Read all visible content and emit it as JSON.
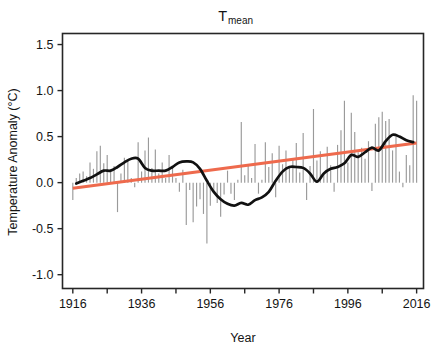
{
  "chart_data": {
    "type": "bar",
    "title_main": "T",
    "title_subscript": "mean",
    "xlabel": "Year",
    "ylabel": "Temperature Anomaly (°C)",
    "xlim": [
      1913,
      2018
    ],
    "ylim": [
      -1.15,
      1.62
    ],
    "xticks": [
      1916,
      1936,
      1956,
      1976,
      1996,
      2016
    ],
    "xtick_labels": [
      "1916",
      "1936",
      "1956",
      "1976",
      "1996",
      "2016"
    ],
    "yticks": [
      1.5,
      1.0,
      0.5,
      0.0,
      -0.5,
      -1.0
    ],
    "ytick_labels": [
      "1.5",
      "1.0",
      "0.5",
      "0.0",
      "-0.5",
      "-1.0"
    ],
    "grid": false,
    "legend": null,
    "colors": {
      "bars": "#9a9a9a",
      "smooth": "#111111",
      "trend": "#ee6a4d",
      "axis": "#262626",
      "background": "#ffffff"
    },
    "series": [
      {
        "name": "Annual temperature anomaly",
        "type": "bar",
        "x": [
          1916,
          1917,
          1918,
          1919,
          1920,
          1921,
          1922,
          1923,
          1924,
          1925,
          1926,
          1927,
          1928,
          1929,
          1930,
          1931,
          1932,
          1933,
          1934,
          1935,
          1936,
          1937,
          1938,
          1939,
          1940,
          1941,
          1942,
          1943,
          1944,
          1945,
          1946,
          1947,
          1948,
          1949,
          1950,
          1951,
          1952,
          1953,
          1954,
          1955,
          1956,
          1957,
          1958,
          1959,
          1960,
          1961,
          1962,
          1963,
          1964,
          1965,
          1966,
          1967,
          1968,
          1969,
          1970,
          1971,
          1972,
          1973,
          1974,
          1975,
          1976,
          1977,
          1978,
          1979,
          1980,
          1981,
          1982,
          1983,
          1984,
          1985,
          1986,
          1987,
          1988,
          1989,
          1990,
          1991,
          1992,
          1993,
          1994,
          1995,
          1996,
          1997,
          1998,
          1999,
          2000,
          2001,
          2002,
          2003,
          2004,
          2005,
          2006,
          2007,
          2008,
          2009,
          2010,
          2011,
          2012,
          2013,
          2014,
          2015,
          2016
        ],
        "values": [
          -0.19,
          0.05,
          0.1,
          0.12,
          0.07,
          0.22,
          0.15,
          0.34,
          0.4,
          0.21,
          0.3,
          0.12,
          0.18,
          -0.32,
          0.1,
          0.27,
          0.24,
          0.05,
          -0.05,
          0.44,
          0.12,
          0.35,
          0.49,
          0.16,
          0.36,
          0.1,
          0.22,
          0.05,
          0.3,
          0.18,
          0.05,
          -0.1,
          0.14,
          -0.46,
          -0.08,
          -0.43,
          -0.26,
          -0.18,
          -0.34,
          -0.66,
          -0.25,
          -0.1,
          -0.22,
          -0.37,
          -0.13,
          0.13,
          -0.12,
          -0.19,
          0.03,
          0.66,
          0.08,
          0.2,
          0.05,
          0.42,
          -0.12,
          0.03,
          0.44,
          0.17,
          0.32,
          -0.16,
          0.4,
          0.2,
          0.35,
          0.18,
          0.25,
          0.43,
          0.11,
          0.54,
          -0.19,
          0.18,
          0.8,
          0.24,
          0.34,
          0.1,
          0.39,
          0.19,
          -0.1,
          0.41,
          0.57,
          0.89,
          0.22,
          0.76,
          0.55,
          0.33,
          0.38,
          0.26,
          0.45,
          -0.09,
          0.64,
          0.71,
          0.77,
          0.67,
          0.69,
          0.35,
          0.5,
          0.12,
          -0.05,
          0.3,
          0.19,
          0.95,
          0.89
        ]
      },
      {
        "name": "Smoothed trend (LOESS)",
        "type": "line",
        "x": [
          1917,
          1919,
          1921,
          1923,
          1925,
          1927,
          1929,
          1931,
          1933,
          1935,
          1937,
          1939,
          1941,
          1943,
          1945,
          1947,
          1949,
          1951,
          1953,
          1955,
          1957,
          1959,
          1961,
          1963,
          1965,
          1967,
          1969,
          1971,
          1973,
          1975,
          1977,
          1979,
          1981,
          1983,
          1985,
          1987,
          1989,
          1991,
          1993,
          1995,
          1997,
          1999,
          2001,
          2003,
          2005,
          2007,
          2009,
          2011,
          2013,
          2015
        ],
        "values": [
          -0.01,
          0.02,
          0.05,
          0.09,
          0.13,
          0.13,
          0.17,
          0.22,
          0.26,
          0.26,
          0.16,
          0.13,
          0.13,
          0.13,
          0.17,
          0.22,
          0.23,
          0.22,
          0.15,
          0.02,
          -0.1,
          -0.18,
          -0.23,
          -0.25,
          -0.22,
          -0.24,
          -0.19,
          -0.16,
          -0.1,
          0.02,
          0.12,
          0.17,
          0.17,
          0.16,
          0.1,
          0.01,
          0.1,
          0.15,
          0.17,
          0.21,
          0.3,
          0.28,
          0.33,
          0.38,
          0.35,
          0.45,
          0.52,
          0.5,
          0.46,
          0.44
        ]
      },
      {
        "name": "Linear trend",
        "type": "line",
        "x": [
          1916,
          2016
        ],
        "values": [
          -0.06,
          0.43
        ]
      }
    ]
  },
  "axes": {
    "title_main": "T",
    "title_subscript": "mean",
    "x_axis_title": "Year",
    "y_axis_title": "Temperature Anomaly (°C)"
  }
}
